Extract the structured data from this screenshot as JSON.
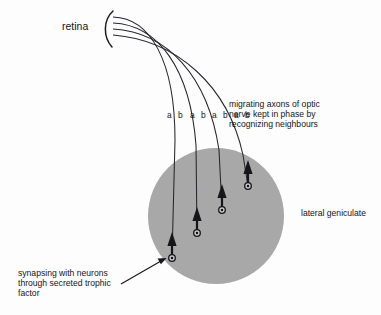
{
  "figure": {
    "title_retina": "retina",
    "labels": {
      "migrating": "migrating axons of optic\nnerve kept in phase by\nrecognizing neighbours",
      "geniculate": "lateral geniculate",
      "synapsing": "synapsing with neurons\nthrough secreted trophic\nfactor"
    },
    "axon_markers": [
      {
        "a": "a",
        "b": "b",
        "x": 167
      },
      {
        "a": "a",
        "b": "b",
        "x": 190
      },
      {
        "a": "a",
        "b": "b",
        "x": 212
      },
      {
        "a": "a",
        "b": "b",
        "x": 234
      }
    ],
    "colors": {
      "background": "#fdfdfd",
      "geniculate_fill": "#a8a8a8",
      "line": "#1b1b20",
      "text": "#15151a"
    },
    "geometry": {
      "geniculate_center_x": 216,
      "geniculate_center_y": 216,
      "geniculate_radius": 68
    }
  }
}
